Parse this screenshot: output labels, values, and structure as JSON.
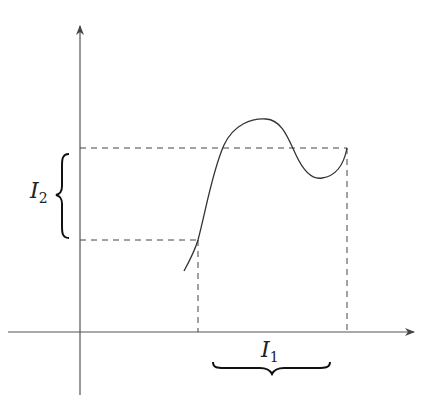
{
  "diagram": {
    "type": "function-graph",
    "labels": {
      "interval_x": {
        "base": "I",
        "sub": "1"
      },
      "interval_y": {
        "base": "I",
        "sub": "2"
      }
    },
    "colors": {
      "axis": "#555555",
      "curve": "#333333",
      "dashed": "#444444",
      "brace": "#111111"
    }
  }
}
